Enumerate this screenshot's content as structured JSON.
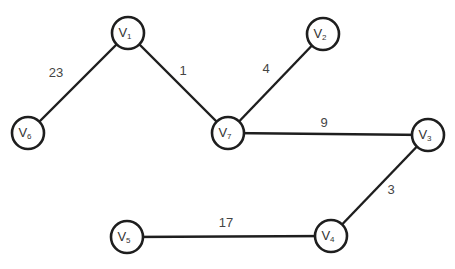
{
  "graph": {
    "style": {
      "stroke": "#1e1e1e",
      "fill": "#ffffff",
      "text": "#333333"
    },
    "node_radius": 16,
    "nodes": [
      {
        "id": "V1",
        "base": "V",
        "sub": "1",
        "x": 128,
        "y": 33
      },
      {
        "id": "V2",
        "base": "V",
        "sub": "2",
        "x": 323,
        "y": 34
      },
      {
        "id": "V3",
        "base": "V",
        "sub": "3",
        "x": 428,
        "y": 135
      },
      {
        "id": "V4",
        "base": "V",
        "sub": "4",
        "x": 331,
        "y": 236
      },
      {
        "id": "V5",
        "base": "V",
        "sub": "5",
        "x": 127,
        "y": 237
      },
      {
        "id": "V6",
        "base": "V",
        "sub": "6",
        "x": 28,
        "y": 133
      },
      {
        "id": "V7",
        "base": "V",
        "sub": "7",
        "x": 228,
        "y": 133
      }
    ],
    "edges": [
      {
        "from": "V1",
        "to": "V6",
        "weight": "23",
        "label_x": 56,
        "label_y": 77
      },
      {
        "from": "V1",
        "to": "V7",
        "weight": "1",
        "label_x": 183,
        "label_y": 75
      },
      {
        "from": "V7",
        "to": "V2",
        "weight": "4",
        "label_x": 266,
        "label_y": 73
      },
      {
        "from": "V7",
        "to": "V3",
        "weight": "9",
        "label_x": 324,
        "label_y": 127
      },
      {
        "from": "V3",
        "to": "V4",
        "weight": "3",
        "label_x": 391,
        "label_y": 194
      },
      {
        "from": "V5",
        "to": "V4",
        "weight": "17",
        "label_x": 226,
        "label_y": 227
      }
    ]
  }
}
